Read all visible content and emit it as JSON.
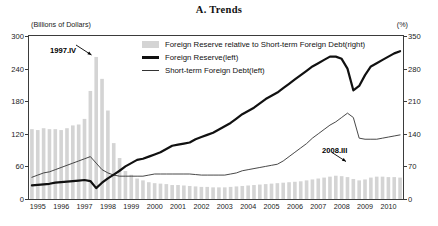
{
  "title": "A. Trends",
  "axes": {
    "unit_left": "(Billions of Dollars)",
    "unit_right": "(%)",
    "left_ticks": [
      0,
      60,
      120,
      180,
      240,
      300
    ],
    "right_ticks": [
      0,
      70,
      140,
      210,
      280,
      350
    ],
    "x_ticks": [
      "1995",
      "1996",
      "1997",
      "1998",
      "1999",
      "2000",
      "2001",
      "2002",
      "2003",
      "2004",
      "2005",
      "2006",
      "2007",
      "2008",
      "2009",
      "2010"
    ]
  },
  "legend": {
    "items": [
      {
        "label": "Foreign Reserve  relative to Short-term Foreign Debt(right)",
        "marker": "bar-swatch"
      },
      {
        "label": "Foreign Reserve(left)",
        "marker": "thick-line"
      },
      {
        "label": "Short-term Foreign Debt(left)",
        "marker": "thin-line"
      }
    ]
  },
  "annotations": [
    {
      "text": "1997.IV",
      "target_x": 1997.875,
      "target_value": 305
    },
    {
      "text": "2008.III",
      "target_x": 2008.625,
      "target_value": 47
    }
  ],
  "colors": {
    "bar": "#d4d4d4",
    "reserve_line": "#111111",
    "debt_line": "#333333",
    "frame": "#3b3b3b",
    "text": "#1a1a1a"
  },
  "chart_data": {
    "type": "bar",
    "title": "A. Trends",
    "xlabel": "",
    "ylabel": "Billions of Dollars",
    "ylabel_right": "%",
    "ylim": [
      0,
      300
    ],
    "ylim_right": [
      0,
      350
    ],
    "grid": false,
    "legend_position": "top-center-inside",
    "x": [
      "1995.I",
      "1995.II",
      "1995.III",
      "1995.IV",
      "1996.I",
      "1996.II",
      "1996.III",
      "1996.IV",
      "1997.I",
      "1997.II",
      "1997.III",
      "1997.IV",
      "1998.I",
      "1998.II",
      "1998.III",
      "1998.IV",
      "1999.I",
      "1999.II",
      "1999.III",
      "1999.IV",
      "2000.I",
      "2000.II",
      "2000.III",
      "2000.IV",
      "2001.I",
      "2001.II",
      "2001.III",
      "2001.IV",
      "2002.I",
      "2002.II",
      "2002.III",
      "2002.IV",
      "2003.I",
      "2003.II",
      "2003.III",
      "2003.IV",
      "2004.I",
      "2004.II",
      "2004.III",
      "2004.IV",
      "2005.I",
      "2005.II",
      "2005.III",
      "2005.IV",
      "2006.I",
      "2006.II",
      "2006.III",
      "2006.IV",
      "2007.I",
      "2007.II",
      "2007.III",
      "2007.IV",
      "2008.I",
      "2008.II",
      "2008.III",
      "2008.IV",
      "2009.I",
      "2009.II",
      "2009.III",
      "2009.IV",
      "2010.I",
      "2010.II",
      "2010.III",
      "2010.IV"
    ],
    "series": [
      {
        "name": "Foreign Reserve  relative to Short-term Foreign Debt(right)",
        "type": "bar",
        "axis": "right",
        "unit": "%",
        "color": "#d4d4d4",
        "values": [
          150,
          148,
          152,
          150,
          150,
          148,
          152,
          158,
          160,
          172,
          232,
          305,
          258,
          190,
          120,
          88,
          60,
          52,
          44,
          40,
          36,
          34,
          33,
          32,
          30,
          30,
          29,
          28,
          27,
          26,
          26,
          25,
          25,
          25,
          26,
          27,
          28,
          29,
          30,
          31,
          32,
          33,
          34,
          35,
          36,
          37,
          38,
          40,
          42,
          44,
          46,
          48,
          50,
          49,
          47,
          43,
          40,
          42,
          46,
          48,
          48,
          47,
          47,
          46
        ]
      },
      {
        "name": "Foreign Reserve(left)",
        "type": "line",
        "axis": "left",
        "unit": "Billions of Dollars",
        "color": "#111111",
        "values": [
          25,
          26,
          27,
          28,
          30,
          31,
          32,
          33,
          34,
          35,
          33,
          20,
          30,
          38,
          45,
          52,
          60,
          66,
          72,
          74,
          78,
          82,
          86,
          92,
          98,
          100,
          102,
          104,
          110,
          114,
          118,
          122,
          128,
          134,
          140,
          148,
          156,
          162,
          168,
          176,
          184,
          190,
          196,
          204,
          212,
          220,
          228,
          236,
          244,
          250,
          256,
          262,
          262,
          258,
          240,
          200,
          208,
          228,
          244,
          250,
          256,
          262,
          268,
          272
        ]
      },
      {
        "name": "Short-term Foreign Debt(left)",
        "type": "line",
        "axis": "left",
        "unit": "Billions of Dollars",
        "color": "#333333",
        "values": [
          40,
          44,
          48,
          50,
          54,
          58,
          62,
          66,
          70,
          74,
          78,
          66,
          54,
          48,
          44,
          42,
          42,
          42,
          42,
          42,
          44,
          46,
          46,
          46,
          46,
          46,
          46,
          46,
          45,
          44,
          44,
          44,
          44,
          44,
          46,
          48,
          52,
          54,
          56,
          58,
          60,
          62,
          64,
          70,
          78,
          86,
          94,
          102,
          112,
          120,
          128,
          136,
          142,
          150,
          158,
          150,
          112,
          110,
          110,
          110,
          112,
          114,
          116,
          118
        ]
      }
    ]
  }
}
